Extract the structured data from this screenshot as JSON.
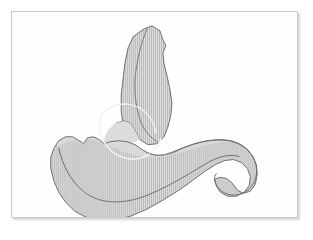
{
  "document": {
    "kind": "anatomical-line-illustration",
    "subject": "vertebra-oblique-view",
    "background_color": "#ffffff"
  },
  "plate": {
    "border_color": "#c9c9c9",
    "fill_color": "#fefefe",
    "shadow_color": "#787878",
    "x": 11,
    "y": 11,
    "width": 287,
    "height": 207
  },
  "illustration": {
    "name": "vertebra-figure",
    "bone_fill": "#d9d9d9",
    "bone_fill_light": "#e3e3e3",
    "outline_color": "#6b6b6b",
    "inner_line_color": "#7a7a7a",
    "highlight_color": "#f2f2f2",
    "hatch_color": "#b4b4b4",
    "hatch_spacing": 2,
    "hatch_orientation": "vertical",
    "parts": [
      {
        "name": "spinous-process",
        "label": "Spinous process",
        "path": "M133,17 L141,14 L149,19 L152,28 L155,34 L152,41 L153,52 L156,64 L159,78 L161,92 L160,104 L157,116 L153,126 L146,133 L137,134 L129,129 L124,120 L119,112 L113,110 L105,112 L99,118 L95,126 L93,133 L97,132 L106,126 L112,115 L110,100 L110,84 L112,66 L114,50 L117,36 L122,25 Z"
      },
      {
        "name": "spinous-process-inner-ridge",
        "label": "Spinous process ridge",
        "path": "M136,17 L130,31 L126,48 L124,66 L124,84 L126,100 L131,114 L138,124 L146,130"
      },
      {
        "name": "lamina-wing",
        "label": "Lamina",
        "path": "M119,112 L113,110 L104,112 L97,119 L93,128 L92,136 L100,136 L110,134 L121,132 L130,130 L124,121 Z"
      },
      {
        "name": "vertebral-body",
        "label": "Vertebral body",
        "path": "M93,133 L88,129 L82,126 L76,127 L72,133 L68,130 L61,126 L54,126 L47,130 L42,138 L39,147 L39,158 L42,170 L47,182 L54,192 L63,201 L74,207 L88,210 L104,210 L120,206 L136,199 L152,190 L168,180 L182,170 L194,161 L205,154 L214,150 L223,149 L231,152 L237,158 L240,166 L239,175 L234,182 L226,186 L217,186 L210,182 L206,176 L204,169 L209,167 L216,168 L222,173 L227,180 L233,183 L240,181 L245,174 L247,164 L246,154 L242,145 L236,138 L228,133 L219,130 L208,129 L196,130 L184,133 L173,137 L163,141 L154,144 L146,145 L138,143 L131,139 L124,134 L116,131 L107,130 L99,131 Z"
      },
      {
        "name": "transverse-process-right",
        "label": "Transverse process (right)",
        "path": "M160,140 L175,134 L190,130 L205,128 L219,129 L230,134 L238,142 L243,153 L244,165 L241,176 L234,183 L225,186 L216,185 L209,180 L205,172 L206,165"
      },
      {
        "name": "superior-articular-notch",
        "label": "Superior articular notch",
        "path": "M68,130 L61,126 L54,126 L47,130 L42,138"
      },
      {
        "name": "glenoid-arc-highlight",
        "label": "Articular facet arc",
        "path": "M89,106 A34,34 0 1 0 135,124"
      },
      {
        "name": "body-shading-divider",
        "label": "Body shading divider",
        "path": "M48,138 L53,155 L61,170 L73,182 L88,189 L105,191 L123,188 L141,181 L159,172 L176,162 L192,153 L206,147 L218,145 L228,147"
      },
      {
        "name": "pedicle-shadow",
        "label": "Pedicle shadow",
        "path": "M131,139 L138,143 L146,145 L154,144 L163,141"
      }
    ]
  }
}
